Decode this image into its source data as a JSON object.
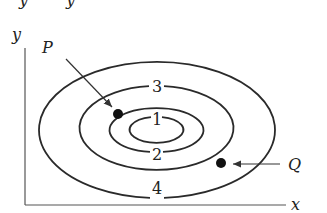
{
  "diagram": {
    "type": "contour-plot",
    "axes": {
      "x_label": "x",
      "y_label": "y"
    },
    "contours": [
      {
        "label": "1",
        "cx": 156,
        "cy": 130,
        "rx": 27,
        "ry": 13
      },
      {
        "label": "2",
        "cx": 156,
        "cy": 130,
        "rx": 47,
        "ry": 22
      },
      {
        "label": "3",
        "cx": 156,
        "cy": 128,
        "rx": 77,
        "ry": 42
      },
      {
        "label": "4",
        "cx": 156,
        "cy": 130,
        "rx": 118,
        "ry": 68
      }
    ],
    "points": [
      {
        "label": "P",
        "x": 118,
        "y": 114
      },
      {
        "label": "Q",
        "x": 221,
        "y": 163
      }
    ],
    "top_fragment": "y    y"
  }
}
